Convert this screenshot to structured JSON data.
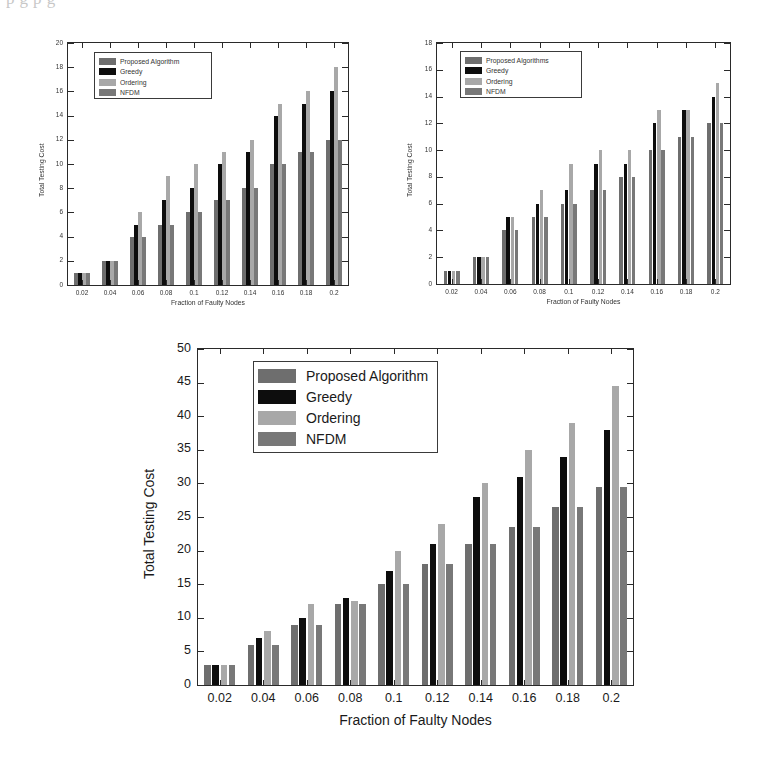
{
  "page": {
    "scan_artifact_text": "p    g                                                                            p              g"
  },
  "colors": {
    "proposed": "#6e6e6e",
    "greedy": "#0d0d0d",
    "ordering": "#a8a8a8",
    "nfdm": "#787878",
    "axis": "#2a2a2a",
    "background": "#ffffff"
  },
  "series_names": [
    "Proposed Algorithm",
    "Greedy",
    "Ordering",
    "NFDM"
  ],
  "charts": [
    {
      "id": "chart-top-left",
      "legend": {
        "items": [
          {
            "label": "Proposed Algorithm",
            "color_key": "proposed"
          },
          {
            "label": "Greedy",
            "color_key": "greedy"
          },
          {
            "label": "Ordering",
            "color_key": "ordering"
          },
          {
            "label": "NFDM",
            "color_key": "nfdm"
          }
        ]
      },
      "chart_data": {
        "type": "bar",
        "title": "",
        "xlabel": "Fraction of Faulty Nodes",
        "ylabel": "Total Testing Cost",
        "categories": [
          "0.02",
          "0.04",
          "0.06",
          "0.08",
          "0.1",
          "0.12",
          "0.14",
          "0.16",
          "0.18",
          "0.2"
        ],
        "ylim": [
          0,
          20
        ],
        "yticks": [
          0,
          2,
          4,
          6,
          8,
          10,
          12,
          14,
          16,
          18,
          20
        ],
        "grid": false,
        "legend_position": "upper-left",
        "series": [
          {
            "name": "Proposed Algorithm",
            "values": [
              1,
              2,
              4,
              5,
              6,
              7,
              8,
              10,
              11,
              12
            ]
          },
          {
            "name": "Greedy",
            "values": [
              1,
              2,
              5,
              7,
              8,
              10,
              11,
              14,
              15,
              16
            ]
          },
          {
            "name": "Ordering",
            "values": [
              1,
              2,
              6,
              9,
              10,
              11,
              12,
              15,
              16,
              18
            ]
          },
          {
            "name": "NFDM",
            "values": [
              1,
              2,
              4,
              5,
              6,
              7,
              8,
              10,
              11,
              12
            ]
          }
        ]
      }
    },
    {
      "id": "chart-top-right",
      "legend": {
        "items": [
          {
            "label": "Proposed Algorithms",
            "color_key": "proposed"
          },
          {
            "label": "Greedy",
            "color_key": "greedy"
          },
          {
            "label": "Ordering",
            "color_key": "ordering"
          },
          {
            "label": "NFDM",
            "color_key": "nfdm"
          }
        ]
      },
      "chart_data": {
        "type": "bar",
        "title": "",
        "xlabel": "Fraction of Faulty Nodes",
        "ylabel": "Total Testing Cost",
        "categories": [
          "0.02",
          "0.04",
          "0.06",
          "0.08",
          "0.1",
          "0.12",
          "0.14",
          "0.16",
          "0.18",
          "0.2"
        ],
        "ylim": [
          0,
          18
        ],
        "yticks": [
          0,
          2,
          4,
          6,
          8,
          10,
          12,
          14,
          16,
          18
        ],
        "grid": false,
        "legend_position": "upper-left",
        "series": [
          {
            "name": "Proposed Algorithms",
            "values": [
              1,
              2,
              4,
              5,
              6,
              7,
              8,
              10,
              11,
              12
            ]
          },
          {
            "name": "Greedy",
            "values": [
              1,
              2,
              5,
              6,
              7,
              9,
              9,
              12,
              13,
              14
            ]
          },
          {
            "name": "Ordering",
            "values": [
              1,
              2,
              5,
              7,
              9,
              10,
              10,
              13,
              13,
              15
            ]
          },
          {
            "name": "NFDM",
            "values": [
              1,
              2,
              4,
              5,
              6,
              7,
              8,
              10,
              11,
              12
            ]
          }
        ]
      }
    },
    {
      "id": "chart-bottom",
      "legend": {
        "items": [
          {
            "label": "Proposed Algorithm",
            "color_key": "proposed"
          },
          {
            "label": "Greedy",
            "color_key": "greedy"
          },
          {
            "label": "Ordering",
            "color_key": "ordering"
          },
          {
            "label": "NFDM",
            "color_key": "nfdm"
          }
        ]
      },
      "chart_data": {
        "type": "bar",
        "title": "",
        "xlabel": "Fraction of Faulty Nodes",
        "ylabel": "Total Testing Cost",
        "categories": [
          "0.02",
          "0.04",
          "0.06",
          "0.08",
          "0.1",
          "0.12",
          "0.14",
          "0.16",
          "0.18",
          "0.2"
        ],
        "ylim": [
          0,
          50
        ],
        "yticks": [
          0,
          5,
          10,
          15,
          20,
          25,
          30,
          35,
          40,
          45,
          50
        ],
        "grid": false,
        "legend_position": "upper-left",
        "series": [
          {
            "name": "Proposed Algorithm",
            "values": [
              3,
              6,
              9,
              12,
              15,
              18,
              21,
              23.5,
              26.5,
              29.5
            ]
          },
          {
            "name": "Greedy",
            "values": [
              3,
              7,
              10,
              13,
              17,
              21,
              28,
              31,
              34,
              38
            ]
          },
          {
            "name": "Ordering",
            "values": [
              3,
              8,
              12,
              12.5,
              20,
              24,
              30,
              35,
              39,
              44.5
            ]
          },
          {
            "name": "NFDM",
            "values": [
              3,
              6,
              9,
              12,
              15,
              18,
              21,
              23.5,
              26.5,
              29.5
            ]
          }
        ]
      }
    }
  ]
}
